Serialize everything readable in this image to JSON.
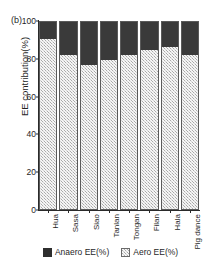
{
  "panel": {
    "label": "(b)"
  },
  "chart_data": {
    "type": "bar",
    "subtype": "stacked-bar-100",
    "title": "",
    "subtitle": "",
    "xlabel": "",
    "ylabel": "EE contribution(%)",
    "ylim": [
      0,
      100
    ],
    "yticks": [
      0,
      20,
      40,
      60,
      80,
      100
    ],
    "ytick_labels": [
      "0",
      "20",
      "40",
      "60",
      "80",
      "100"
    ],
    "grid": false,
    "legend_position": "bottom",
    "categories": [
      "Hua",
      "Sasa",
      "Siao",
      "Tanlan",
      "Tongan",
      "Filan",
      "Hala",
      "Pig dance"
    ],
    "series": [
      {
        "name": "Anaero EE(%)",
        "color": "#3a3a3a",
        "values": [
          9.4,
          18.1,
          23.1,
          20.5,
          17.8,
          15.2,
          13.9,
          18.1
        ]
      },
      {
        "name": "Aero EE(%)",
        "color": "#d3d3d3",
        "values": [
          90.6,
          81.9,
          76.9,
          79.5,
          82.2,
          84.8,
          86.1,
          81.9
        ]
      }
    ]
  },
  "legend": {
    "items": [
      {
        "label": "Anaero EE(%)",
        "swatch": "dark"
      },
      {
        "label": "Aero EE(%)",
        "swatch": "light"
      }
    ]
  }
}
